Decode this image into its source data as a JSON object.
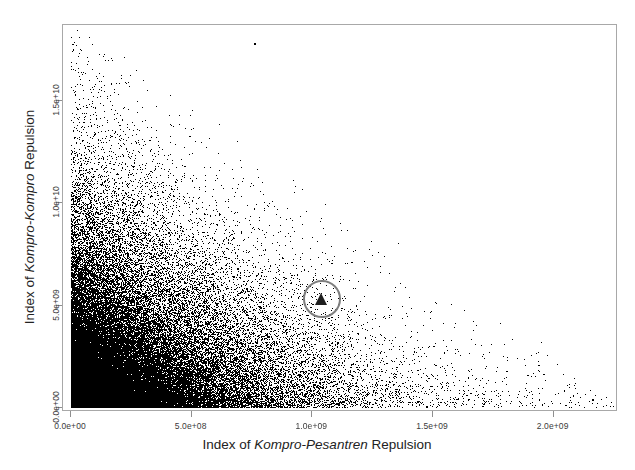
{
  "figure": {
    "background": "#ffffff",
    "frame_color": "#a8a8a8",
    "point_color": "#000000",
    "highlight_color": "#7d7d7d",
    "marker_color": "#1e1e1e"
  },
  "axes": {
    "x_title_prefix": "Index of ",
    "x_title_emphasis": "Kompro-Pesantren",
    "x_title_suffix": " Repulsion",
    "y_title_prefix": "Index of ",
    "y_title_emphasis": "Kompro-Kompro",
    "y_title_suffix": " Repulsion",
    "x_ticklabels": [
      "0.0e+00",
      "5.0e+08",
      "1.0e+09",
      "1.5e+09",
      "2.0e+09"
    ],
    "y_ticklabels": [
      "0.0e+00",
      "5.0e+09",
      "1.0e+10",
      "1.5e+10"
    ]
  },
  "annotation": {
    "circle_label": "highlighted-observation-circle",
    "marker_label": "highlighted-observation-triangle"
  },
  "chart_data": {
    "type": "scatter",
    "title": "",
    "xlabel": "Index of Kompro-Pesantren Repulsion",
    "ylabel": "Index of Kompro-Kompro Repulsion",
    "xlim": [
      0,
      2250000000.0
    ],
    "ylim": [
      0,
      18500000000.0
    ],
    "xticks": [
      0,
      500000000,
      1000000000,
      1500000000,
      2000000000
    ],
    "yticks": [
      0,
      5000000000,
      10000000000,
      15000000000
    ],
    "xticklabels": [
      "0.0e+00",
      "5.0e+08",
      "1.0e+09",
      "1.5e+09",
      "2.0e+09"
    ],
    "yticklabels": [
      "0.0e+00",
      "5.0e+09",
      "1.0e+10",
      "1.5e+10"
    ],
    "grid": false,
    "legend": null,
    "n_points": 50000,
    "point_size_px": 1,
    "point_color": "#000000",
    "distribution": {
      "description": "Dense convex cloud concentrated at the origin, decaying outward; saturated solid black for x<3.5e+08 and y<4e+09, thinning to sparse isolated points along both the upper-left and lower-right tails. Upper-right quadrant is empty.",
      "x_mode": 0,
      "y_mode": 0,
      "x_decay_scale": 330000000,
      "y_decay_scale": 3200000000,
      "joint_constraint": "x/2.25e9 + y/1.85e10 <~ 1.05 (convex frontier)"
    },
    "highlight": {
      "shape": "filled-triangle-in-open-circle",
      "x": 1040000000,
      "y": 5300000000,
      "circle_radius_px": 19,
      "circle_color": "#7d7d7d",
      "marker_color": "#1e1e1e"
    },
    "extremes": {
      "max_y_point": {
        "x": 760000000,
        "y": 17800000000.0
      },
      "max_x_point": {
        "x": 2160000000.0,
        "y": 400000000.0
      }
    }
  }
}
